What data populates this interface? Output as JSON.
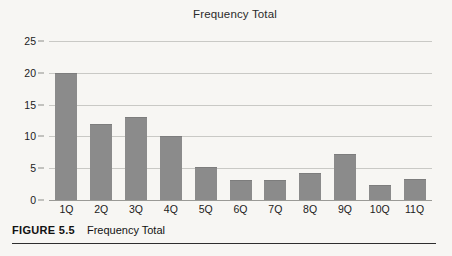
{
  "chart_data": {
    "type": "bar",
    "title": "Frequency Total",
    "xlabel": "",
    "ylabel": "",
    "categories": [
      "1Q",
      "2Q",
      "3Q",
      "4Q",
      "5Q",
      "6Q",
      "7Q",
      "8Q",
      "9Q",
      "10Q",
      "11Q"
    ],
    "values": [
      20.0,
      12.0,
      13.0,
      10.1,
      5.2,
      3.2,
      3.2,
      4.3,
      7.3,
      2.3,
      3.3
    ],
    "ylim": [
      0,
      25
    ],
    "ytick_labels": [
      "0",
      "5",
      "10",
      "15",
      "20",
      "25"
    ],
    "ytick_values": [
      0,
      5,
      10,
      15,
      20,
      25
    ],
    "grid": true,
    "legend": false,
    "bar_color": "#8b8b8b",
    "gridline_color": "#c9c9c5"
  },
  "caption": {
    "label": "FIGURE 5.5",
    "text": "Frequency Total"
  }
}
